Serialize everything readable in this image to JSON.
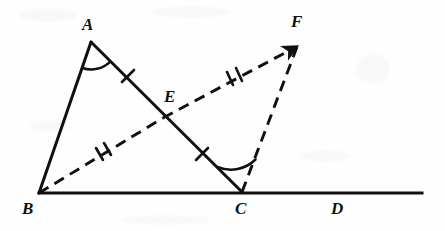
{
  "figure": {
    "kind": "geometry-diagram",
    "width": 445,
    "height": 231,
    "background_color": "#fefefe",
    "ink_color": "#101010",
    "points": [
      {
        "id": "A",
        "label": "A",
        "x": 91,
        "y": 42,
        "label_x": 82,
        "label_y": 16
      },
      {
        "id": "B",
        "label": "B",
        "x": 39,
        "y": 193,
        "label_x": 22,
        "label_y": 200
      },
      {
        "id": "C",
        "label": "C",
        "x": 242,
        "y": 192,
        "label_x": 235,
        "label_y": 200
      },
      {
        "id": "D",
        "label": "D",
        "x": 338,
        "y": 192,
        "label_x": 331,
        "label_y": 200
      },
      {
        "id": "E",
        "label": "E",
        "x": 163,
        "y": 118,
        "label_x": 164,
        "label_y": 88
      },
      {
        "id": "F",
        "label": "F",
        "x": 298,
        "y": 45,
        "label_x": 291,
        "label_y": 13
      }
    ],
    "segments": [
      {
        "id": "AB",
        "from": "A",
        "to": "B",
        "style": "solid",
        "ticks": 0
      },
      {
        "id": "AE",
        "from": "A",
        "to": "E",
        "style": "solid",
        "ticks": 1
      },
      {
        "id": "EC",
        "from": "E",
        "to": "C",
        "style": "solid",
        "ticks": 1
      },
      {
        "id": "BD",
        "from": "B",
        "to": "D",
        "style": "solid",
        "ticks": 0,
        "note": "baseline extends past D to x=422"
      },
      {
        "id": "BE",
        "from": "B",
        "to": "E",
        "style": "dashed",
        "ticks": 2
      },
      {
        "id": "EF",
        "from": "E",
        "to": "F",
        "style": "dashed",
        "ticks": 2,
        "arrow": true
      },
      {
        "id": "CF",
        "from": "C",
        "to": "F",
        "style": "dashed",
        "ticks": 0
      }
    ],
    "angle_marks": [
      {
        "id": "angle-A",
        "vertex": "A",
        "rays": [
          "B",
          "C"
        ],
        "arcs": 1
      },
      {
        "id": "angle-C",
        "vertex": "C",
        "rays": [
          "A",
          "F"
        ],
        "arcs": 1
      }
    ],
    "tick_counts": {
      "single": [
        "AE",
        "EC"
      ],
      "double": [
        "BE",
        "EF"
      ]
    },
    "baseline": {
      "x1": 39,
      "x2": 422,
      "y": 193
    }
  }
}
